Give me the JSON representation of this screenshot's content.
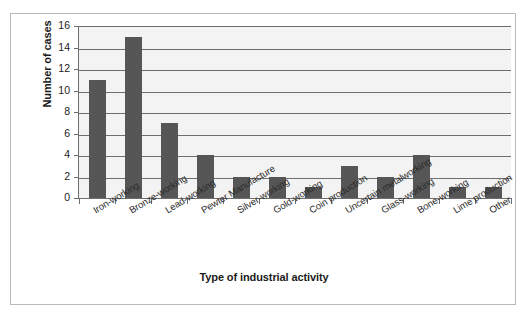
{
  "chart_data": {
    "type": "bar",
    "title": "",
    "xlabel": "Type of  industrial  activity",
    "ylabel": "Number of cases",
    "ylim": [
      0,
      16
    ],
    "ytick_step": 2,
    "yticks": [
      "16",
      "14",
      "12",
      "10",
      "8",
      "6",
      "4",
      "2",
      "0"
    ],
    "grid": true,
    "legend": false,
    "bar_color": "#565656",
    "plot_background": "#f3f3f3",
    "axis_color": "#6e6e6e",
    "categories": [
      "Iron-working",
      "Bronze-working",
      "Lead-working",
      "Pewter Manufacture",
      "Silver-working",
      "Gold-working",
      "Coin production",
      "Uncertain metalworking",
      "Glass-working",
      "Bone-working",
      "Lime production",
      "Other"
    ],
    "values": [
      11,
      15,
      7,
      4,
      2,
      2,
      1,
      3,
      2,
      4,
      1,
      1
    ]
  }
}
